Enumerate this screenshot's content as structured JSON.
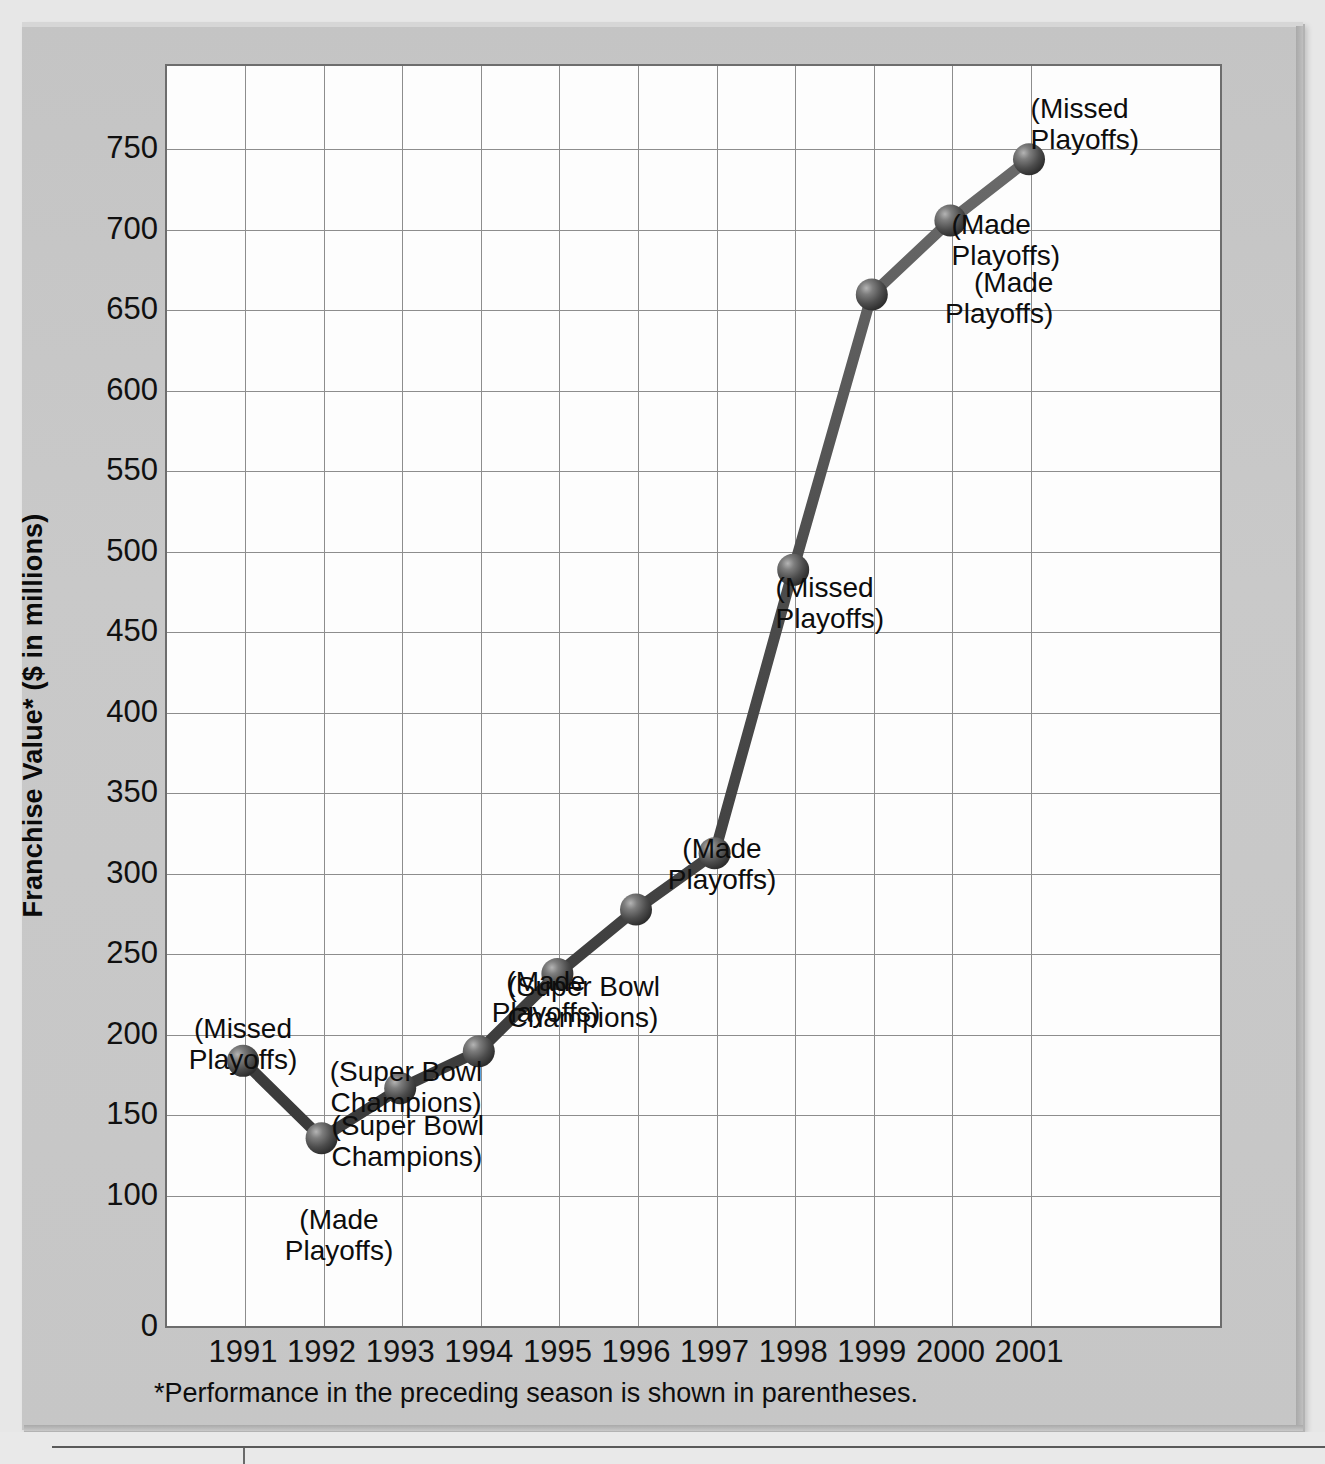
{
  "chart_data": {
    "type": "line",
    "title": "",
    "xlabel": "",
    "ylabel": "Franchise Value* ($ in millions)",
    "footnote": "*Performance in the preceding season is shown in parentheses.",
    "grid": true,
    "legend": "none",
    "ylim": [
      0,
      775
    ],
    "y_ticks": [
      "0",
      "100",
      "150",
      "200",
      "250",
      "300",
      "350",
      "400",
      "450",
      "500",
      "550",
      "600",
      "650",
      "700",
      "750"
    ],
    "y_tick_values": [
      0,
      100,
      150,
      200,
      250,
      300,
      350,
      400,
      450,
      500,
      550,
      600,
      650,
      700,
      750
    ],
    "categories": [
      "1991",
      "1992",
      "1993",
      "1994",
      "1995",
      "1996",
      "1997",
      "1998",
      "1999",
      "2000",
      "2001"
    ],
    "values": [
      183,
      135,
      166,
      189,
      237,
      277,
      312,
      488,
      659,
      705,
      743
    ],
    "point_labels": [
      "(Missed\nPlayoffs)",
      "(Made\nPlayoffs)",
      "(Super Bowl\nChampions)",
      "(Super Bowl\nChampions)",
      "(Made\nPlayoffs)",
      "(Super Bowl\nChampions)",
      "(Made\nPlayoffs)",
      "(Missed\nPlayoffs)",
      "(Made\nPlayoffs)",
      "(Made\nPlayoffs)",
      "(Missed\nPlayoffs)"
    ],
    "colors": {
      "line": "#4e4e4e",
      "marker": "#4a4a4a",
      "plot_background": "#fdfdfd",
      "panel_background": "#c9c9c9",
      "grid": "#8d8d8d",
      "axis": "#6d6d6d",
      "text": "#101010"
    }
  },
  "annotations": [
    {
      "text": "(Missed\nPlayoffs)",
      "x": 243,
      "y": 1013,
      "align": "c"
    },
    {
      "text": "(Made\nPlayoffs)",
      "x": 339,
      "y": 1204,
      "align": "c"
    },
    {
      "text": "(Super Bowl\nChampions)",
      "x": 406,
      "y": 1056,
      "align": "c"
    },
    {
      "text": "(Super Bowl\nChampions)",
      "x": 484,
      "y": 1110,
      "align": "r"
    },
    {
      "text": "(Made\nPlayoffs)",
      "x": 546,
      "y": 966,
      "align": "c"
    },
    {
      "text": "(Super Bowl\nChampions)",
      "x": 660,
      "y": 971,
      "align": "r"
    },
    {
      "text": "(Made\nPlayoffs)",
      "x": 722,
      "y": 833,
      "align": "c"
    },
    {
      "text": "(Missed\nPlayoffs)",
      "x": 884,
      "y": 572,
      "align": "r"
    },
    {
      "text": "(Made\nPlayoffs)",
      "x": 945,
      "y": 267,
      "align": "l"
    },
    {
      "text": "(Made\nPlayoffs)",
      "x": 1060,
      "y": 209,
      "align": "r"
    },
    {
      "text": "(Missed\nPlayoffs)",
      "x": 1139,
      "y": 93,
      "align": "r"
    }
  ]
}
